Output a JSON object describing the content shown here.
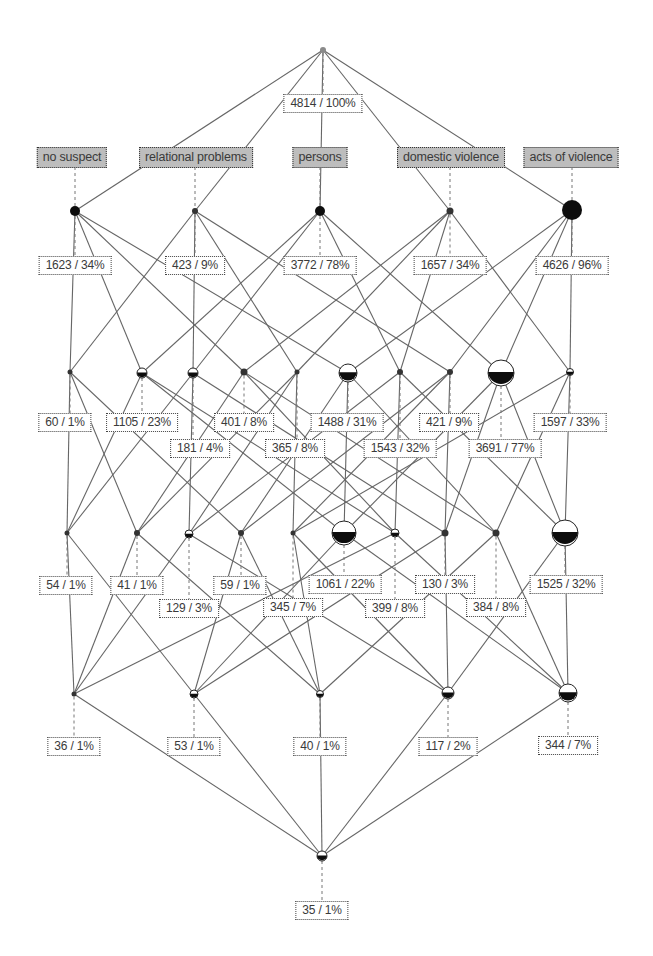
{
  "diagram": {
    "type": "concept-lattice",
    "colors": {
      "edge": "#666666",
      "node": "#111111",
      "attribute_box": "#bdbdbd",
      "label_box": "#ffffff"
    },
    "attributes": [
      {
        "id": "A",
        "label": "no suspect",
        "x": 72,
        "y": 147
      },
      {
        "id": "B",
        "label": "relational problems",
        "x": 196,
        "y": 147
      },
      {
        "id": "C",
        "label": "persons",
        "x": 320,
        "y": 147
      },
      {
        "id": "D",
        "label": "domestic violence",
        "x": 451,
        "y": 147
      },
      {
        "id": "E",
        "label": "acts of violence",
        "x": 571,
        "y": 147
      }
    ],
    "nodes": [
      {
        "id": "top",
        "attrs": [],
        "x": 323,
        "y": 50,
        "r": 3,
        "style": "grey",
        "count": 4814,
        "percent": "100%",
        "label": "4814 / 100%",
        "lx": 323,
        "ly": 94
      },
      {
        "id": "A",
        "attrs": [
          "A"
        ],
        "x": 75,
        "y": 211,
        "r": 5,
        "style": "full",
        "count": 1623,
        "percent": "34%",
        "label": "1623 / 34%",
        "lx": 75,
        "ly": 256
      },
      {
        "id": "B",
        "attrs": [
          "B"
        ],
        "x": 195,
        "y": 211,
        "r": 3,
        "style": "dot",
        "count": 423,
        "percent": "9%",
        "label": "423 / 9%",
        "lx": 195,
        "ly": 256
      },
      {
        "id": "C",
        "attrs": [
          "C"
        ],
        "x": 320,
        "y": 211,
        "r": 5,
        "style": "full",
        "count": 3772,
        "percent": "78%",
        "label": "3772 / 78%",
        "lx": 320,
        "ly": 256
      },
      {
        "id": "D",
        "attrs": [
          "D"
        ],
        "x": 450,
        "y": 211,
        "r": 3.5,
        "style": "dot",
        "count": 1657,
        "percent": "34%",
        "label": "1657 / 34%",
        "lx": 450,
        "ly": 256
      },
      {
        "id": "E",
        "attrs": [
          "E"
        ],
        "x": 572,
        "y": 210,
        "r": 10,
        "style": "full",
        "count": 4626,
        "percent": "96%",
        "label": "4626 / 96%",
        "lx": 572,
        "ly": 256
      },
      {
        "id": "AB",
        "attrs": [
          "A",
          "B"
        ],
        "x": 70,
        "y": 372,
        "r": 2.5,
        "style": "dot",
        "count": 60,
        "percent": "1%",
        "label": "60 / 1%",
        "lx": 65,
        "ly": 413
      },
      {
        "id": "AC",
        "attrs": [
          "A",
          "C"
        ],
        "x": 142,
        "y": 373,
        "r": 5,
        "style": "half",
        "count": 1105,
        "percent": "23%",
        "label": "1105 / 23%",
        "lx": 142,
        "ly": 413
      },
      {
        "id": "BC",
        "attrs": [
          "B",
          "C"
        ],
        "x": 193,
        "y": 373,
        "r": 5,
        "style": "half",
        "count": 181,
        "percent": "4%",
        "label": "181 / 4%",
        "lx": 200,
        "ly": 439
      },
      {
        "id": "AD",
        "attrs": [
          "A",
          "D"
        ],
        "x": 244,
        "y": 372,
        "r": 3.5,
        "style": "dot",
        "count": 401,
        "percent": "8%",
        "label": "401 / 8%",
        "lx": 244,
        "ly": 413
      },
      {
        "id": "BD",
        "attrs": [
          "B",
          "D"
        ],
        "x": 297,
        "y": 372,
        "r": 2.5,
        "style": "dot",
        "count": 365,
        "percent": "8%",
        "label": "365 / 8%",
        "lx": 295,
        "ly": 439
      },
      {
        "id": "AE",
        "attrs": [
          "A",
          "E"
        ],
        "x": 348,
        "y": 373,
        "r": 9,
        "style": "half",
        "count": 1488,
        "percent": "31%",
        "label": "1488 / 31%",
        "lx": 347,
        "ly": 413
      },
      {
        "id": "CD",
        "attrs": [
          "C",
          "D"
        ],
        "x": 400,
        "y": 372,
        "r": 3,
        "style": "dot",
        "count": 1543,
        "percent": "32%",
        "label": "1543 / 32%",
        "lx": 400,
        "ly": 439
      },
      {
        "id": "BE",
        "attrs": [
          "B",
          "E"
        ],
        "x": 450,
        "y": 372,
        "r": 3,
        "style": "dot",
        "count": 421,
        "percent": "9%",
        "label": "421 / 9%",
        "lx": 449,
        "ly": 413
      },
      {
        "id": "CE",
        "attrs": [
          "C",
          "E"
        ],
        "x": 501,
        "y": 373,
        "r": 13,
        "style": "half",
        "count": 3691,
        "percent": "77%",
        "label": "3691 / 77%",
        "lx": 505,
        "ly": 439
      },
      {
        "id": "DE",
        "attrs": [
          "D",
          "E"
        ],
        "x": 570,
        "y": 372,
        "r": 3.5,
        "style": "half",
        "count": 1597,
        "percent": "33%",
        "label": "1597 / 33%",
        "lx": 570,
        "ly": 413
      },
      {
        "id": "ABC",
        "attrs": [
          "A",
          "B",
          "C"
        ],
        "x": 67,
        "y": 533,
        "r": 2.5,
        "style": "dot",
        "count": 54,
        "percent": "1%",
        "label": "54 / 1%",
        "lx": 66,
        "ly": 576
      },
      {
        "id": "ABD",
        "attrs": [
          "A",
          "B",
          "D"
        ],
        "x": 137,
        "y": 533,
        "r": 3,
        "style": "dot",
        "count": 41,
        "percent": "1%",
        "label": "41 / 1%",
        "lx": 137,
        "ly": 576
      },
      {
        "id": "BCD",
        "attrs": [
          "B",
          "C",
          "D"
        ],
        "x": 189,
        "y": 534,
        "r": 4,
        "style": "half",
        "count": 129,
        "percent": "3%",
        "label": "129 / 3%",
        "lx": 189,
        "ly": 599
      },
      {
        "id": "ABE",
        "attrs": [
          "A",
          "B",
          "E"
        ],
        "x": 241,
        "y": 533,
        "r": 3,
        "style": "dot",
        "count": 59,
        "percent": "1%",
        "label": "59 / 1%",
        "lx": 240,
        "ly": 576
      },
      {
        "id": "BDE",
        "attrs": [
          "B",
          "D",
          "E"
        ],
        "x": 293,
        "y": 533,
        "r": 2.5,
        "style": "dot",
        "count": 345,
        "percent": "7%",
        "label": "345 / 7%",
        "lx": 293,
        "ly": 598
      },
      {
        "id": "ACE",
        "attrs": [
          "A",
          "C",
          "E"
        ],
        "x": 344,
        "y": 533,
        "r": 12,
        "style": "half",
        "count": 1061,
        "percent": "22%",
        "label": "1061 / 22%",
        "lx": 345,
        "ly": 575
      },
      {
        "id": "ACD",
        "attrs": [
          "A",
          "C",
          "D"
        ],
        "x": 395,
        "y": 533,
        "r": 4,
        "style": "half",
        "count": 399,
        "percent": "8%",
        "label": "399 / 8%",
        "lx": 395,
        "ly": 599
      },
      {
        "id": "BCE",
        "attrs": [
          "B",
          "C",
          "E"
        ],
        "x": 445,
        "y": 533,
        "r": 3.5,
        "style": "dot",
        "count": 130,
        "percent": "3%",
        "label": "130 / 3%",
        "lx": 445,
        "ly": 575
      },
      {
        "id": "ADE",
        "attrs": [
          "A",
          "D",
          "E"
        ],
        "x": 496,
        "y": 533,
        "r": 3.5,
        "style": "dot",
        "count": 384,
        "percent": "8%",
        "label": "384 / 8%",
        "lx": 496,
        "ly": 598
      },
      {
        "id": "CDE",
        "attrs": [
          "C",
          "D",
          "E"
        ],
        "x": 565,
        "y": 533,
        "r": 13,
        "style": "half",
        "count": 1525,
        "percent": "32%",
        "label": "1525 / 32%",
        "lx": 566,
        "ly": 575
      },
      {
        "id": "ABCD",
        "attrs": [
          "A",
          "B",
          "C",
          "D"
        ],
        "x": 74,
        "y": 694,
        "r": 2.5,
        "style": "dot",
        "count": 36,
        "percent": "1%",
        "label": "36 / 1%",
        "lx": 74,
        "ly": 737
      },
      {
        "id": "ABCE",
        "attrs": [
          "A",
          "B",
          "C",
          "E"
        ],
        "x": 194,
        "y": 694,
        "r": 4,
        "style": "half",
        "count": 53,
        "percent": "1%",
        "label": "53 / 1%",
        "lx": 194,
        "ly": 737
      },
      {
        "id": "ABDE",
        "attrs": [
          "A",
          "B",
          "D",
          "E"
        ],
        "x": 320,
        "y": 694,
        "r": 3.5,
        "style": "half",
        "count": 40,
        "percent": "1%",
        "label": "40 / 1%",
        "lx": 320,
        "ly": 737
      },
      {
        "id": "BCDE",
        "attrs": [
          "B",
          "C",
          "D",
          "E"
        ],
        "x": 448,
        "y": 693,
        "r": 6,
        "style": "half",
        "count": 117,
        "percent": "2%",
        "label": "117 / 2%",
        "lx": 448,
        "ly": 737
      },
      {
        "id": "ACDE",
        "attrs": [
          "A",
          "C",
          "D",
          "E"
        ],
        "x": 568,
        "y": 693,
        "r": 9,
        "style": "half",
        "count": 344,
        "percent": "7%",
        "label": "344 / 7%",
        "lx": 568,
        "ly": 736
      },
      {
        "id": "bottom",
        "attrs": [
          "A",
          "B",
          "C",
          "D",
          "E"
        ],
        "x": 322,
        "y": 856,
        "r": 5,
        "style": "half",
        "count": 35,
        "percent": "1%",
        "label": "35 / 1%",
        "lx": 322,
        "ly": 901
      }
    ]
  }
}
